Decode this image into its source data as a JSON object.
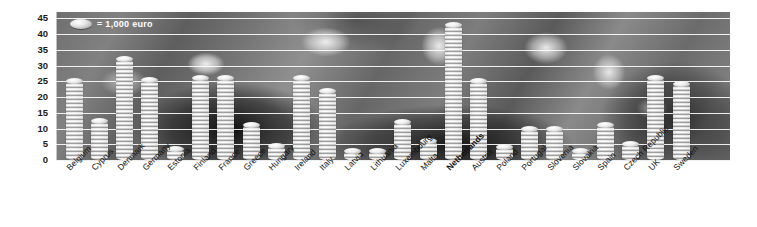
{
  "chart_data": {
    "type": "bar",
    "title": "",
    "subtitle": "",
    "xlabel": "",
    "ylabel": "",
    "ylim": [
      0,
      47
    ],
    "grid": true,
    "legend_position": "top-left",
    "unit_note": "= 1,000 euro",
    "yticks": [
      0,
      5,
      10,
      15,
      20,
      25,
      30,
      35,
      40,
      45
    ],
    "categories": [
      "Belgium",
      "Cyprus",
      "Denmark",
      "Germany",
      "Estonia",
      "Finland",
      "France",
      "Greece",
      "Hungary",
      "Ireland",
      "Italy",
      "Latvia",
      "Lithuania",
      "Luxembourg",
      "Malta",
      "Netherlands",
      "Austria",
      "Poland",
      "Portugal",
      "Slovenia",
      "Slovakia",
      "Spain",
      "Czech Republic",
      "UK",
      "Sweden"
    ],
    "values": [
      25,
      12.5,
      32,
      25.5,
      3.5,
      26,
      26,
      11,
      4.5,
      26,
      22,
      3,
      3,
      12,
      6,
      43,
      25,
      4,
      10,
      10,
      3,
      11,
      5,
      26,
      24
    ],
    "highlighted_categories": [
      "Netherlands"
    ],
    "series": [
      {
        "name": "Amount (1,000 euro)",
        "values": [
          25,
          12.5,
          32,
          25.5,
          3.5,
          26,
          26,
          11,
          4.5,
          26,
          22,
          3,
          3,
          12,
          6,
          43,
          25,
          4,
          10,
          10,
          3,
          11,
          5,
          26,
          24
        ]
      }
    ]
  },
  "legend": {
    "coin_icon": "coin-icon",
    "text": "= 1,000 euro"
  },
  "colors": {
    "gridline": "#ffffff",
    "tick_text": "#1a1a1a",
    "label_text": "#111111",
    "legend_text": "#ffffff",
    "bar_light": "#ffffff",
    "bar_dark": "#7b7b7b",
    "background": "#6f6f6f"
  }
}
